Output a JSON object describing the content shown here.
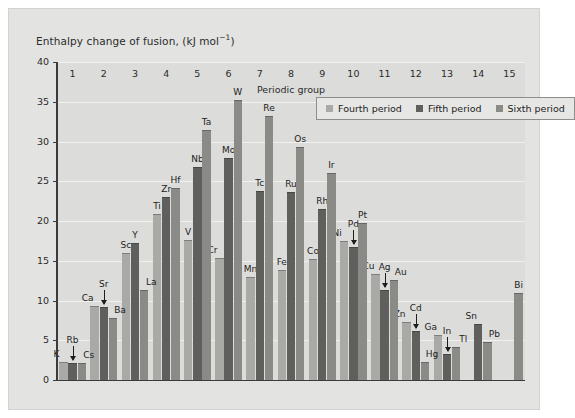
{
  "figure": {
    "background": "#e3e3e1",
    "plot_background": "#dcdcda"
  },
  "chart_title": "Enthalpy change of fusion, (kJ mol",
  "chart_title_sup": "−1",
  "chart_title_close": ")",
  "legend": {
    "items": [
      {
        "label": "Fourth period",
        "color": "#a9a9a5"
      },
      {
        "label": "Fifth period",
        "color": "#5f5f5d"
      },
      {
        "label": "Sixth period",
        "color": "#8a8a86"
      }
    ]
  },
  "axes": {
    "y": {
      "label": "Enthalpy change of fusion, (kJ mol−1)",
      "ticks": [
        0,
        5,
        10,
        15,
        20,
        25,
        30,
        35,
        40
      ],
      "min": 0,
      "max": 40
    },
    "x": {
      "label": "Periodic group",
      "ticks": [
        "1",
        "2",
        "3",
        "4",
        "5",
        "6",
        "7",
        "8",
        "9",
        "10",
        "11",
        "12",
        "13",
        "14",
        "15"
      ]
    }
  },
  "chart_data": {
    "type": "bar",
    "title": "Enthalpy change of fusion, (kJ mol−1)",
    "xlabel": "Periodic group",
    "ylabel": "Enthalpy change of fusion, (kJ mol−1)",
    "ylim": [
      0,
      40
    ],
    "grid": true,
    "legend_position": "upper-right-inside",
    "categories": [
      "1",
      "2",
      "3",
      "4",
      "5",
      "6",
      "7",
      "8",
      "9",
      "10",
      "11",
      "12",
      "13",
      "14",
      "15"
    ],
    "series": [
      {
        "name": "Fourth period",
        "color": "#a9a9a5",
        "points": [
          {
            "group": "1",
            "element": "K",
            "value": 2.3
          },
          {
            "group": "2",
            "element": "Ca",
            "value": 9.3
          },
          {
            "group": "3",
            "element": "Sc",
            "value": 16.0
          },
          {
            "group": "4",
            "element": "Ti",
            "value": 20.9
          },
          {
            "group": "5",
            "element": "V",
            "value": 17.6
          },
          {
            "group": "6",
            "element": "Cr",
            "value": 15.3
          },
          {
            "group": "7",
            "element": "Mn",
            "value": 12.9
          },
          {
            "group": "8",
            "element": "Fe",
            "value": 13.8
          },
          {
            "group": "9",
            "element": "Co",
            "value": 15.2
          },
          {
            "group": "10",
            "element": "Ni",
            "value": 17.5
          },
          {
            "group": "11",
            "element": "Cu",
            "value": 13.3
          },
          {
            "group": "12",
            "element": "Zn",
            "value": 7.3
          },
          {
            "group": "13",
            "element": "Ga",
            "value": 5.6
          },
          {
            "group": "14",
            "element": null,
            "value": null
          },
          {
            "group": "15",
            "element": null,
            "value": null
          }
        ]
      },
      {
        "name": "Fifth period",
        "color": "#5f5f5d",
        "points": [
          {
            "group": "1",
            "element": "Rb",
            "value": 2.2
          },
          {
            "group": "2",
            "element": "Sr",
            "value": 9.2
          },
          {
            "group": "3",
            "element": "Y",
            "value": 17.2
          },
          {
            "group": "4",
            "element": "Zr",
            "value": 23.0
          },
          {
            "group": "5",
            "element": "Nb",
            "value": 26.8
          },
          {
            "group": "6",
            "element": "Mo",
            "value": 27.9
          },
          {
            "group": "7",
            "element": "Tc",
            "value": 23.8
          },
          {
            "group": "8",
            "element": "Ru",
            "value": 23.7
          },
          {
            "group": "9",
            "element": "Rh",
            "value": 21.5
          },
          {
            "group": "10",
            "element": "Pd",
            "value": 16.7
          },
          {
            "group": "11",
            "element": "Ag",
            "value": 11.3
          },
          {
            "group": "12",
            "element": "Cd",
            "value": 6.2
          },
          {
            "group": "13",
            "element": "In",
            "value": 3.3
          },
          {
            "group": "14",
            "element": "Sn",
            "value": 7.0
          },
          {
            "group": "15",
            "element": null,
            "value": null
          }
        ]
      },
      {
        "name": "Sixth period",
        "color": "#8a8a86",
        "points": [
          {
            "group": "1",
            "element": "Cs",
            "value": 2.1
          },
          {
            "group": "2",
            "element": "Ba",
            "value": 7.8
          },
          {
            "group": "3",
            "element": "La",
            "value": 11.3
          },
          {
            "group": "4",
            "element": "Hf",
            "value": 24.1
          },
          {
            "group": "5",
            "element": "Ta",
            "value": 31.4
          },
          {
            "group": "6",
            "element": "W",
            "value": 35.2
          },
          {
            "group": "7",
            "element": "Re",
            "value": 33.2
          },
          {
            "group": "8",
            "element": "Os",
            "value": 29.3
          },
          {
            "group": "9",
            "element": "Ir",
            "value": 26.1
          },
          {
            "group": "10",
            "element": "Pt",
            "value": 19.7
          },
          {
            "group": "11",
            "element": "Au",
            "value": 12.6
          },
          {
            "group": "12",
            "element": "Hg",
            "value": 2.3
          },
          {
            "group": "13",
            "element": "Tl",
            "value": 4.2
          },
          {
            "group": "14",
            "element": "Pb",
            "value": 4.8
          },
          {
            "group": "15",
            "element": "Bi",
            "value": 10.9
          }
        ]
      }
    ]
  }
}
